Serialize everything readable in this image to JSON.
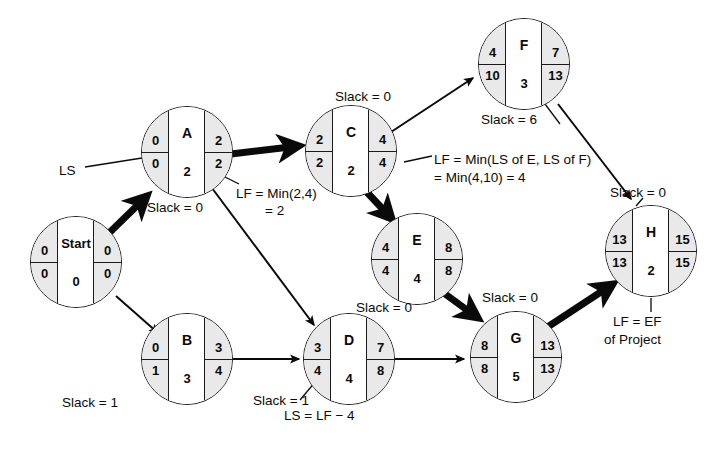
{
  "diagram": {
    "accent_color": "#1a1a1a",
    "node_fill_side": "#e9e9e9",
    "node_fill_middle": "#ffffff"
  },
  "legend_fields": {
    "es": "ES (earliest start, top-left)",
    "ef": "EF (earliest finish, top-right)",
    "ls": "LS (latest start, bottom-left)",
    "lf": "LF (latest finish, bottom-right)",
    "duration": "duration (bottom-middle)",
    "name": "activity name (top-middle)"
  },
  "nodes": [
    {
      "id": "start",
      "name": "Start",
      "es": "0",
      "ef": "0",
      "ls": "0",
      "lf": "0",
      "duration": "0",
      "x": 30,
      "y": 216,
      "size": 92
    },
    {
      "id": "A",
      "name": "A",
      "es": "0",
      "ef": "2",
      "ls": "0",
      "lf": "2",
      "duration": "2",
      "x": 141,
      "y": 106,
      "size": 92
    },
    {
      "id": "B",
      "name": "B",
      "es": "0",
      "ef": "3",
      "ls": "1",
      "lf": "4",
      "duration": "3",
      "x": 141,
      "y": 313,
      "size": 92
    },
    {
      "id": "C",
      "name": "C",
      "es": "2",
      "ef": "4",
      "ls": "2",
      "lf": "4",
      "duration": "2",
      "x": 305,
      "y": 105,
      "size": 92
    },
    {
      "id": "D",
      "name": "D",
      "es": "3",
      "ef": "7",
      "ls": "4",
      "lf": "8",
      "duration": "4",
      "x": 303,
      "y": 313,
      "size": 92
    },
    {
      "id": "E",
      "name": "E",
      "es": "4",
      "ef": "8",
      "ls": "4",
      "lf": "8",
      "duration": "4",
      "x": 371,
      "y": 213,
      "size": 92
    },
    {
      "id": "F",
      "name": "F",
      "es": "4",
      "ef": "7",
      "ls": "10",
      "lf": "13",
      "duration": "3",
      "x": 478,
      "y": 18,
      "size": 92
    },
    {
      "id": "G",
      "name": "G",
      "es": "8",
      "ef": "13",
      "ls": "8",
      "lf": "13",
      "duration": "5",
      "x": 470,
      "y": 311,
      "size": 92
    },
    {
      "id": "H",
      "name": "H",
      "es": "13",
      "ef": "15",
      "ls": "13",
      "lf": "15",
      "duration": "2",
      "x": 605,
      "y": 205,
      "size": 92
    }
  ],
  "edges": [
    {
      "id": "start-a",
      "from": "start",
      "to": "A",
      "critical": true
    },
    {
      "id": "start-b",
      "from": "start",
      "to": "B",
      "critical": false
    },
    {
      "id": "a-c",
      "from": "A",
      "to": "C",
      "critical": true
    },
    {
      "id": "a-d",
      "from": "A",
      "to": "D",
      "critical": false
    },
    {
      "id": "c-f",
      "from": "C",
      "to": "F",
      "critical": false
    },
    {
      "id": "c-e",
      "from": "C",
      "to": "E",
      "critical": true
    },
    {
      "id": "b-d",
      "from": "B",
      "to": "D",
      "critical": false
    },
    {
      "id": "d-g",
      "from": "D",
      "to": "G",
      "critical": false
    },
    {
      "id": "e-g",
      "from": "E",
      "to": "G",
      "critical": true
    },
    {
      "id": "f-h",
      "from": "F",
      "to": "H",
      "critical": false
    },
    {
      "id": "g-h",
      "from": "G",
      "to": "H",
      "critical": true
    }
  ],
  "annotations": [
    {
      "id": "ls-pointer",
      "text": "LS",
      "x": 59,
      "y": 163
    },
    {
      "id": "slack-a",
      "text": "Slack = 0",
      "x": 147,
      "y": 200
    },
    {
      "id": "slack-b",
      "text": "Slack = 1",
      "x": 62,
      "y": 395
    },
    {
      "id": "slack-c",
      "text": "Slack = 0",
      "x": 335,
      "y": 89
    },
    {
      "id": "slack-d",
      "text": "Slack = 1",
      "x": 253,
      "y": 393
    },
    {
      "id": "slack-e",
      "text": "Slack = 0",
      "x": 356,
      "y": 300
    },
    {
      "id": "slack-f",
      "text": "Slack = 6",
      "x": 481,
      "y": 112
    },
    {
      "id": "slack-g",
      "text": "Slack = 0",
      "x": 482,
      "y": 290
    },
    {
      "id": "slack-h",
      "text": "Slack = 0",
      "x": 610,
      "y": 185
    },
    {
      "id": "lf-a-line1",
      "text": "LF = Min(2,4)",
      "x": 236,
      "y": 186
    },
    {
      "id": "lf-a-line2",
      "text": "= 2",
      "x": 265,
      "y": 203
    },
    {
      "id": "lf-c-line1",
      "text": "LF = Min(LS of E, LS of F)",
      "x": 434,
      "y": 152
    },
    {
      "id": "lf-c-line2",
      "text": "= Min(4,10) = 4",
      "x": 434,
      "y": 170
    },
    {
      "id": "ls-d-note",
      "text": "LS = LF − 4",
      "x": 284,
      "y": 408
    },
    {
      "id": "lf-h-line1",
      "text": "LF = EF",
      "x": 613,
      "y": 314
    },
    {
      "id": "lf-h-line2",
      "text": "of Project",
      "x": 604,
      "y": 332
    }
  ]
}
